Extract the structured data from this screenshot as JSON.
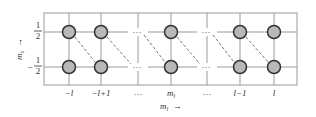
{
  "diagram": {
    "type": "quantum-state-grid",
    "frame": {
      "x1": 44,
      "y1": 13,
      "x2": 297,
      "y2": 85
    },
    "rows": [
      {
        "label_num": "1",
        "label_den": "2",
        "sign": "",
        "value": "1/2",
        "y": 32
      },
      {
        "label_num": "1",
        "label_den": "2",
        "sign": "−",
        "value": "-1/2",
        "y": 67
      }
    ],
    "columns": [
      {
        "label": "−l",
        "x": 69,
        "has_nodes": true
      },
      {
        "label": "−l+1",
        "x": 101,
        "has_nodes": true
      },
      {
        "label": "...",
        "x": 138,
        "has_nodes": false,
        "dots_x": 136
      },
      {
        "label": "m",
        "sub": "l",
        "x": 171,
        "has_nodes": true
      },
      {
        "label": "...",
        "x": 207,
        "has_nodes": false,
        "dots_x": 205
      },
      {
        "label": "l−1",
        "x": 240,
        "has_nodes": true
      },
      {
        "label": "l",
        "x": 274,
        "has_nodes": true
      }
    ],
    "x_axis_label": {
      "text": "m",
      "sub": "l",
      "arrow": "→"
    },
    "y_axis_label": {
      "text": "m",
      "sub": "s",
      "arrow": "→"
    },
    "dashed_links": [
      {
        "from": "-l,1/2",
        "to": "-l+1,-1/2"
      },
      {
        "from": "-l+1,1/2",
        "to": "...,-1/2"
      },
      {
        "from": "...,1/2",
        "to": "m_l,-1/2"
      },
      {
        "from": "m_l,1/2",
        "to": "...,-1/2"
      },
      {
        "from": "...,1/2",
        "to": "l-1,-1/2"
      },
      {
        "from": "l-1,1/2",
        "to": "l,-1/2"
      }
    ],
    "colors": {
      "grid": "#9a9a9a",
      "node_fill": "#b8b8b8",
      "node_stroke": "#333333",
      "dash": "#777777",
      "text": "#333333"
    },
    "ellipsis": "···"
  }
}
